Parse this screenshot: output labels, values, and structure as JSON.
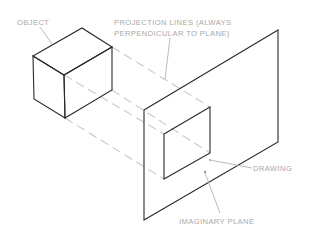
{
  "diagram": {
    "labels": {
      "object": "OBJECT",
      "projection_line1": "PROJECTION LINES (ALWAYS",
      "projection_line2": "PERPENDICULAR TO PLANE)",
      "drawing": "DRAWING",
      "plane": "IMAGINARY PLANE"
    },
    "colors": {
      "edge": "#2a2a2a",
      "projection_lines": "#c8c8c8",
      "label_text": "#a9a9a9",
      "background": "#ffffff"
    },
    "elements": [
      {
        "name": "object",
        "shape": "rectangular-box (isometric)"
      },
      {
        "name": "projection-lines",
        "style": "dashed",
        "count": 4
      },
      {
        "name": "imaginary-plane",
        "shape": "parallelogram"
      },
      {
        "name": "drawing",
        "shape": "parallelogram on plane"
      }
    ]
  }
}
